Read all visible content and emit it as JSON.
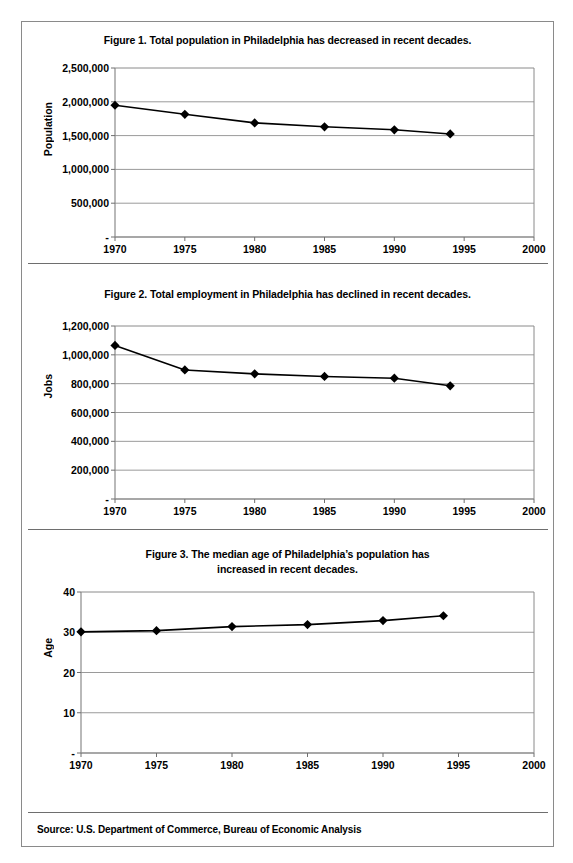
{
  "document": {
    "source_note": "Source: U.S. Department of Commerce, Bureau of Economic Analysis"
  },
  "figures": [
    {
      "id": "figure-1",
      "title": "Figure 1. Total population in Philadelphia has decreased in recent decades.",
      "title_lines": [
        "Figure 1. Total population in Philadelphia has decreased in recent decades."
      ]
    },
    {
      "id": "figure-2",
      "title": "Figure 2. Total employment in Philadelphia has declined in recent decades.",
      "title_lines": [
        "Figure 2. Total employment in Philadelphia has declined in recent decades."
      ]
    },
    {
      "id": "figure-3",
      "title": "Figure 3. The median age of Philadelphia’s population has increased in recent decades.",
      "title_lines": [
        "Figure 3. The median age of Philadelphia’s population has",
        "increased in recent decades."
      ]
    }
  ],
  "chart_data": [
    {
      "type": "line",
      "title": "Figure 1. Total population in Philadelphia has decreased in recent decades.",
      "xlabel": "",
      "ylabel": "Population",
      "x": [
        1970,
        1975,
        1980,
        1985,
        1990,
        1994
      ],
      "values": [
        1948609,
        1815000,
        1688210,
        1630000,
        1585577,
        1524249
      ],
      "xlim": [
        1970,
        2000
      ],
      "ylim": [
        0,
        2500000
      ],
      "xticks": [
        1970,
        1975,
        1980,
        1985,
        1990,
        1995,
        2000
      ],
      "xticklabels": [
        "1970",
        "1975",
        "1980",
        "1985",
        "1990",
        "1995",
        "2000"
      ],
      "yticks": [
        0,
        500000,
        1000000,
        1500000,
        2000000,
        2500000
      ],
      "yticklabels": [
        "-",
        "500,000",
        "1,000,000",
        "1,500,000",
        "2,000,000",
        "2,500,000"
      ],
      "grid": "horizontal",
      "legend": "none",
      "marker": "diamond",
      "color": "#000000"
    },
    {
      "type": "line",
      "title": "Figure 2. Total employment in Philadelphia has declined in recent decades.",
      "xlabel": "",
      "ylabel": "Jobs",
      "x": [
        1970,
        1975,
        1980,
        1985,
        1990,
        1994
      ],
      "values": [
        1065000,
        895000,
        868000,
        850000,
        838000,
        785000
      ],
      "xlim": [
        1970,
        2000
      ],
      "ylim": [
        0,
        1200000
      ],
      "xticks": [
        1970,
        1975,
        1980,
        1985,
        1990,
        1995,
        2000
      ],
      "xticklabels": [
        "1970",
        "1975",
        "1980",
        "1985",
        "1990",
        "1995",
        "2000"
      ],
      "yticks": [
        0,
        200000,
        400000,
        600000,
        800000,
        1000000,
        1200000
      ],
      "yticklabels": [
        "-",
        "200,000",
        "400,000",
        "600,000",
        "800,000",
        "1,000,000",
        "1,200,000"
      ],
      "grid": "horizontal",
      "legend": "none",
      "marker": "diamond",
      "color": "#000000"
    },
    {
      "type": "line",
      "title": "Figure 3. The median age of Philadelphia’s population has increased in recent decades.",
      "xlabel": "",
      "ylabel": "Age",
      "x": [
        1970,
        1975,
        1980,
        1985,
        1990,
        1994
      ],
      "values": [
        30.1,
        30.4,
        31.4,
        31.9,
        32.9,
        34.1
      ],
      "xlim": [
        1970,
        2000
      ],
      "ylim": [
        0,
        40
      ],
      "xticks": [
        1970,
        1975,
        1980,
        1985,
        1990,
        1995,
        2000
      ],
      "xticklabels": [
        "1970",
        "1975",
        "1980",
        "1985",
        "1990",
        "1995",
        "2000"
      ],
      "yticks": [
        0,
        10,
        20,
        30,
        40
      ],
      "yticklabels": [
        "-",
        "10",
        "20",
        "30",
        "40"
      ],
      "grid": "horizontal",
      "legend": "none",
      "marker": "diamond",
      "color": "#000000"
    }
  ]
}
